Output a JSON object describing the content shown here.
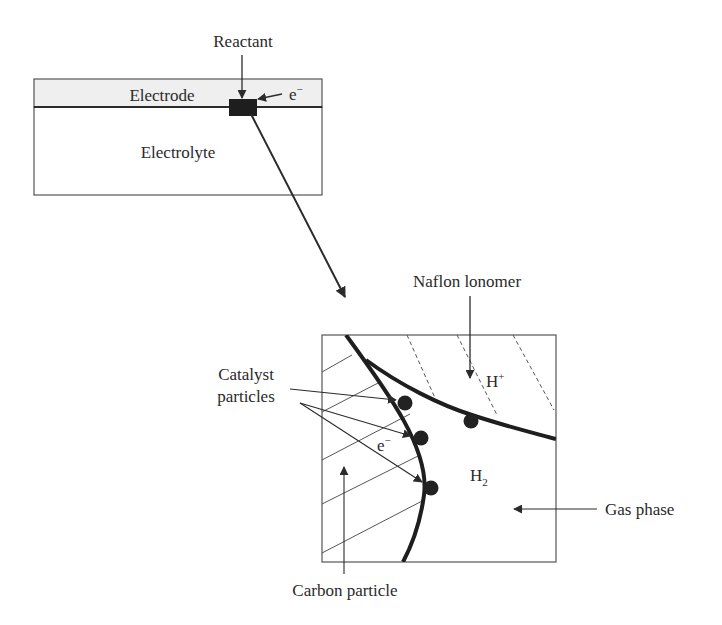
{
  "figure": {
    "top_panel": {
      "reactant_label": "Reactant",
      "electrode_label": "Electrode",
      "electron_label": "e",
      "electron_superscript": "−",
      "electrolyte_label": "Electrolyte",
      "electrode_fill": "#efefef"
    },
    "zoom_panel": {
      "ionomer_label": "Naflon lonomer",
      "proton_label": "H",
      "proton_superscript": "+",
      "catalyst_label_line1": "Catalyst",
      "catalyst_label_line2": "particles",
      "electron_label": "e",
      "electron_superscript": "−",
      "hydrogen_label": "H",
      "hydrogen_subscript": "2",
      "gas_phase_label": "Gas phase",
      "carbon_label": "Carbon particle"
    },
    "colors": {
      "stroke": "#2b2b2b",
      "thin_stroke": "#555555",
      "particle": "#222222"
    }
  }
}
